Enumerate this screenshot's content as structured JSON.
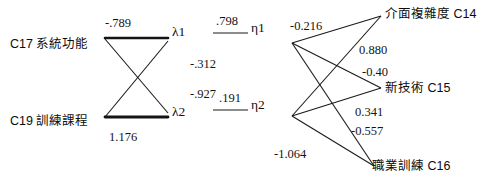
{
  "figure": {
    "type": "path-diagram",
    "background_color": "#ffffff",
    "line_color": "#1a1a1a",
    "text_color": "#111111"
  },
  "nodes": {
    "exogenous": [
      {
        "id": "C17",
        "label": "C17 系統功能",
        "x": 10,
        "y": 38
      },
      {
        "id": "C19",
        "label": "C19 訓練課程",
        "x": 10,
        "y": 115
      }
    ],
    "latent_lambda": [
      {
        "id": "lambda1",
        "label": "λ1",
        "x": 172,
        "y": 25
      },
      {
        "id": "lambda2",
        "label": "λ2",
        "x": 172,
        "y": 105
      }
    ],
    "latent_eta": [
      {
        "id": "eta1",
        "label": "η1",
        "x": 251,
        "y": 21
      },
      {
        "id": "eta2",
        "label": "η2",
        "x": 251,
        "y": 98
      }
    ],
    "endogenous": [
      {
        "id": "C14",
        "label": "介面複雜度 C14",
        "x": 385,
        "y": 8
      },
      {
        "id": "C15",
        "label": "新技術 C15",
        "x": 385,
        "y": 82
      },
      {
        "id": "C16",
        "label": "職業訓練 C16",
        "x": 372,
        "y": 160
      }
    ]
  },
  "coefficients": {
    "c17_to_lambda1": "-.789",
    "c17_to_lambda2": "-.312",
    "c19_to_lambda1": "-.927",
    "c19_to_lambda2": "1.176",
    "lambda1_to_eta1": ".798",
    "lambda2_to_eta2": ".191",
    "eta1_to_c14": "-0.216",
    "eta1_to_c15": "0.880",
    "eta1_to_c16": "-0.40",
    "eta2_to_c14": "0.341",
    "eta2_to_c15": "-0.557",
    "eta2_to_c16": "-1.064"
  },
  "coefficient_positions": [
    {
      "key": "c17_to_lambda1",
      "value": "-.789",
      "x": 105,
      "y": 17
    },
    {
      "key": "c17_to_lambda2",
      "value": "-.312",
      "x": 190,
      "y": 58
    },
    {
      "key": "c19_to_lambda1",
      "value": "-.927",
      "x": 190,
      "y": 88
    },
    {
      "key": "c19_to_lambda2",
      "value": "1.176",
      "x": 109,
      "y": 131
    },
    {
      "key": "lambda1_to_eta1",
      "value": ".798",
      "x": 216,
      "y": 15
    },
    {
      "key": "lambda2_to_eta2",
      "value": ".191",
      "x": 219,
      "y": 92
    },
    {
      "key": "eta1_to_c14",
      "value": "-0.216",
      "x": 290,
      "y": 20
    },
    {
      "key": "eta1_to_c15",
      "value": "0.880",
      "x": 359,
      "y": 44
    },
    {
      "key": "eta1_to_c16",
      "value": "-0.40",
      "x": 362,
      "y": 66
    },
    {
      "key": "eta2_to_c14",
      "value": "0.341",
      "x": 355,
      "y": 106
    },
    {
      "key": "eta2_to_c15",
      "value": "-0.557",
      "x": 351,
      "y": 125
    },
    {
      "key": "eta2_to_c16",
      "value": "-1.064",
      "x": 274,
      "y": 148
    }
  ],
  "edges": [
    {
      "from": "C17",
      "to": "lambda1",
      "x1": 105,
      "y1": 38,
      "x2": 168,
      "y2": 38,
      "weight": "bold"
    },
    {
      "from": "C17",
      "to": "lambda2",
      "x1": 105,
      "y1": 38,
      "x2": 168,
      "y2": 113,
      "weight": "thin"
    },
    {
      "from": "C19",
      "to": "lambda1",
      "x1": 105,
      "y1": 117,
      "x2": 168,
      "y2": 41,
      "weight": "thin"
    },
    {
      "from": "C19",
      "to": "lambda2",
      "x1": 105,
      "y1": 117,
      "x2": 168,
      "y2": 117,
      "weight": "bold"
    },
    {
      "from": "lambda1",
      "to": "eta1",
      "x1": 213,
      "y1": 34,
      "x2": 248,
      "y2": 34,
      "weight": "thin"
    },
    {
      "from": "lambda2",
      "to": "eta2",
      "x1": 213,
      "y1": 111,
      "x2": 248,
      "y2": 111,
      "weight": "thin"
    },
    {
      "from": "eta1",
      "to": "C14",
      "x1": 292,
      "y1": 43,
      "x2": 381,
      "y2": 16,
      "weight": "thin"
    },
    {
      "from": "eta1",
      "to": "C15",
      "x1": 292,
      "y1": 43,
      "x2": 381,
      "y2": 88,
      "weight": "thin"
    },
    {
      "from": "eta1",
      "to": "C16",
      "x1": 292,
      "y1": 43,
      "x2": 375,
      "y2": 166,
      "weight": "thin"
    },
    {
      "from": "eta2",
      "to": "C14",
      "x1": 292,
      "y1": 116,
      "x2": 381,
      "y2": 16,
      "weight": "thin"
    },
    {
      "from": "eta2",
      "to": "C15",
      "x1": 292,
      "y1": 116,
      "x2": 381,
      "y2": 88,
      "weight": "thin"
    },
    {
      "from": "eta2",
      "to": "C16",
      "x1": 292,
      "y1": 116,
      "x2": 375,
      "y2": 166,
      "weight": "thin"
    }
  ]
}
